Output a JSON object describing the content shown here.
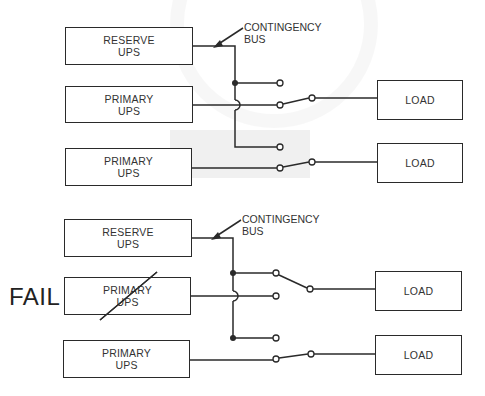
{
  "diagrams": [
    {
      "id": "normal",
      "reserve": {
        "line1": "RESERVE",
        "line2": "UPS"
      },
      "primary1": {
        "line1": "PRIMARY",
        "line2": "UPS"
      },
      "primary2": {
        "line1": "PRIMARY",
        "line2": "UPS"
      },
      "load1": "LOAD",
      "load2": "LOAD",
      "bus_label": "CONTINGENCY\nBUS"
    },
    {
      "id": "failed",
      "fail_label": "FAIL",
      "reserve": {
        "line1": "RESERVE",
        "line2": "UPS"
      },
      "primary1": {
        "line1": "PRIMARY",
        "line2": "UPS"
      },
      "primary2": {
        "line1": "PRIMARY",
        "line2": "UPS"
      },
      "load1": "LOAD",
      "load2": "LOAD",
      "bus_label": "CONTINGENCY\nBUS"
    }
  ],
  "colors": {
    "line": "#2a2a2a",
    "text": "#333333",
    "background": "#ffffff"
  }
}
